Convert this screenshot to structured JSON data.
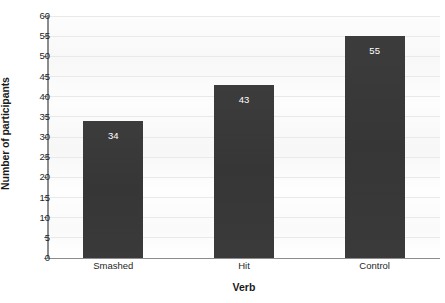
{
  "chart_data": {
    "type": "bar",
    "title": "",
    "categories": [
      "Smashed",
      "Hit",
      "Control"
    ],
    "values": [
      34,
      43,
      55
    ],
    "value_labels": [
      "34",
      "43",
      "55"
    ],
    "xlabel": "Verb",
    "ylabel": "Number of participants",
    "ylim": [
      0,
      60
    ],
    "ytick_step": 5,
    "yticks": [
      0,
      5,
      10,
      15,
      20,
      25,
      30,
      35,
      40,
      45,
      50,
      55,
      60
    ],
    "ytick_labels": [
      "0",
      "5",
      "10",
      "15",
      "20",
      "25",
      "30",
      "35",
      "40",
      "45",
      "50",
      "55",
      "60"
    ],
    "grid": true,
    "grid_axis": "y",
    "legend": false,
    "legend_position": "none",
    "bar_color": "#393939",
    "value_label_color": "#ffffff",
    "axis_color": "#8c8c8c",
    "gridline_color": "#e9e9e9",
    "plot_background": "#fbfbfb",
    "page_background": "#ffffff",
    "text_color": "#1f1f1f"
  }
}
